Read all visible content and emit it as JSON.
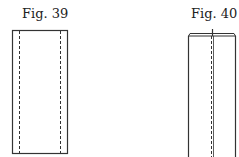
{
  "figures": [
    {
      "label": "Fig. 39",
      "description": "rectangle with two vertical dashed fold lines near each side"
    },
    {
      "label": "Fig. 40",
      "description": "folded narrow strip with a central vertical dashed line and a doubled top edge"
    }
  ],
  "colors": {
    "line": "#333333",
    "background": "#ffffff"
  }
}
